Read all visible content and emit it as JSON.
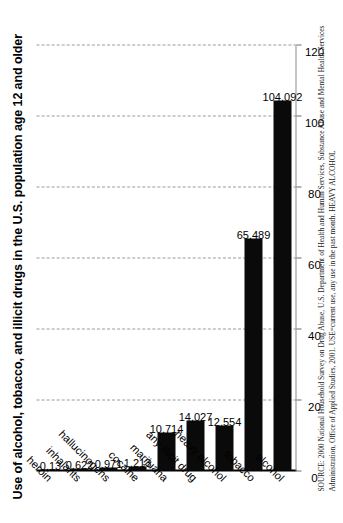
{
  "chart_data": {
    "type": "bar",
    "orientation": "horizontal",
    "title": "Use of alcohol, tobacco, and illicit drugs in the U.S. population age 12 and older",
    "xlabel": "",
    "ylabel": "millions",
    "ylim": [
      0,
      120
    ],
    "grid": true,
    "legend": null,
    "tick_labels": [
      "0",
      "20",
      "40",
      "60",
      "80",
      "100",
      "120"
    ],
    "tick_values": [
      0,
      20,
      40,
      60,
      80,
      100,
      120
    ],
    "categories": [
      "alcohol",
      "tobacco",
      "heavy alcohol",
      "any illicit drug",
      "marijuana",
      "cocaine",
      "hallucinogens",
      "inhalants",
      "heroin"
    ],
    "values": [
      104.092,
      65.489,
      12.554,
      14.027,
      10.714,
      1.213,
      0.971,
      0.622,
      0.13
    ],
    "data_labels": [
      "104,092",
      "65,489",
      "12,554",
      "14,027",
      "10,714",
      "1,213",
      "0.971",
      "0.622",
      "0.13"
    ],
    "bar_color": "#0a0a0a",
    "background_color": "#ffffff",
    "annotations": []
  },
  "figure": {
    "title": "Use of alcohol, tobacco, and illicit drugs in the U.S. population age 12 and older",
    "axis_name": "millions",
    "source": "SOURCE: 2000 National Household Survey on Drug Abuse, U.S. Department of Health and Human Services, Substance Abuse and Mental Health Services Administration, Office of Applied Studies, 2001. USE=current use, any use in the past month. HEAVY ALCOHOL"
  }
}
